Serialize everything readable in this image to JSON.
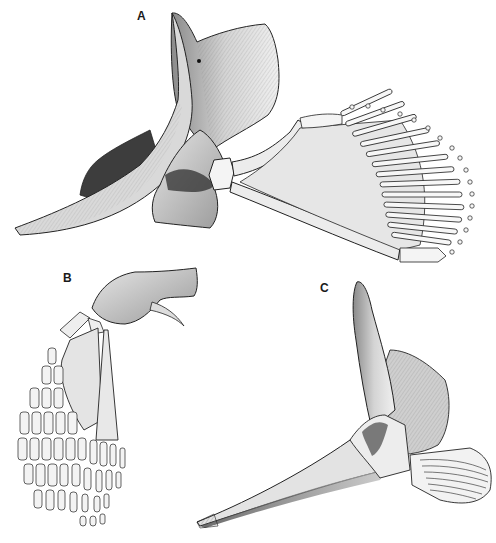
{
  "figure": {
    "panels": [
      {
        "label": "A",
        "x": 137,
        "y": 9
      },
      {
        "label": "B",
        "x": 63,
        "y": 271
      },
      {
        "label": "C",
        "x": 320,
        "y": 281
      }
    ],
    "colors": {
      "ink": "#1a1a1a",
      "bone_light": "#f2f2f2",
      "bone_mid": "#cfcfcf",
      "bone_dark": "#6a6a6a",
      "background": "#ffffff"
    }
  }
}
